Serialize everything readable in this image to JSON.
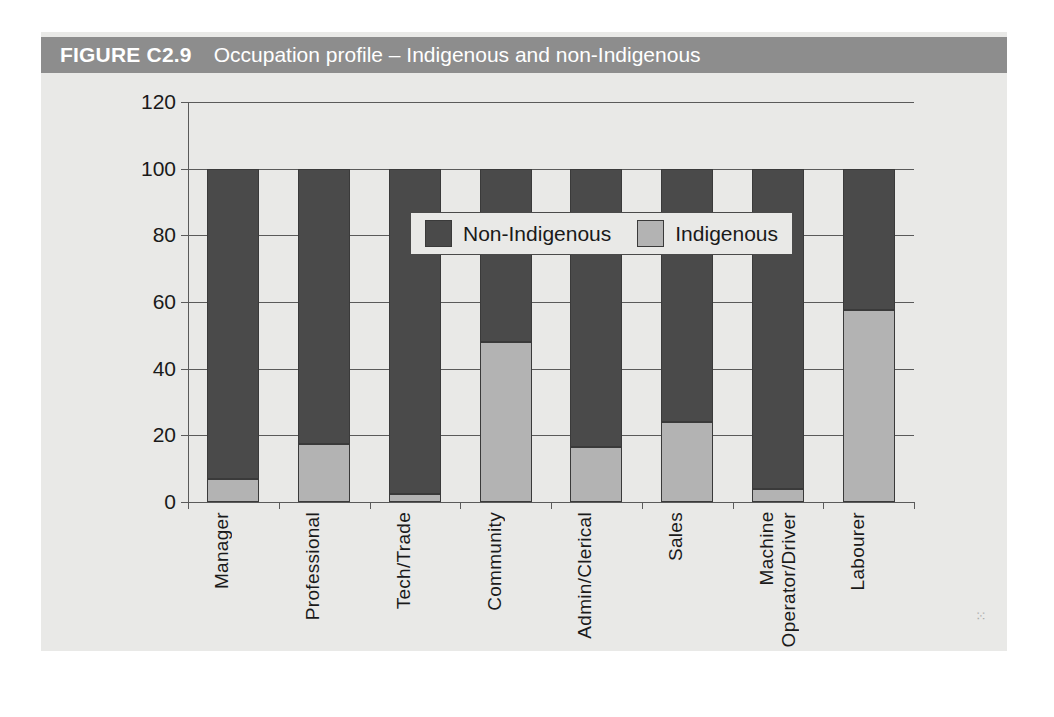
{
  "figure": {
    "number_label": "FIGURE C2.9",
    "title": "Occupation profile – Indigenous and non-Indigenous"
  },
  "colors": {
    "header_bar": "#8d8d8d",
    "panel_background": "#e9e9e7",
    "non_indigenous": "#4a4a4a",
    "indigenous": "#b3b3b3",
    "axis": "#5a5a5a"
  },
  "legend": {
    "position": "inside-top-left",
    "items": [
      {
        "label": "Non-Indigenous",
        "color": "#4a4a4a"
      },
      {
        "label": "Indigenous",
        "color": "#b3b3b3"
      }
    ]
  },
  "chart_data": {
    "type": "bar",
    "stacked": true,
    "title": "Occupation profile – Indigenous and non-Indigenous",
    "xlabel": "",
    "ylabel": "",
    "ylim": [
      0,
      120
    ],
    "yticks": [
      0,
      20,
      40,
      60,
      80,
      100,
      120
    ],
    "ytick_labels": [
      "0",
      "20",
      "40",
      "60",
      "80",
      "100",
      "120"
    ],
    "grid": true,
    "legend_position": "upper left (inside plot)",
    "categories": [
      "Manager",
      "Professional",
      "Tech/Trade",
      "Community",
      "Admin/Clerical",
      "Sales",
      "Machine\nOperator/Driver",
      "Labourer"
    ],
    "series": [
      {
        "name": "Indigenous",
        "color": "#b3b3b3",
        "values": [
          7,
          17.5,
          2.5,
          48,
          16.5,
          24,
          4,
          57.5
        ]
      },
      {
        "name": "Non-Indigenous",
        "color": "#4a4a4a",
        "values": [
          93,
          82.5,
          97.5,
          52,
          83.5,
          76,
          96,
          42.5
        ]
      }
    ]
  }
}
